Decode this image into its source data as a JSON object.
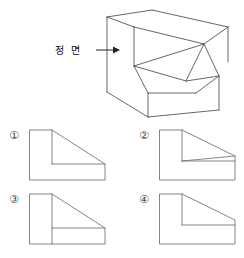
{
  "page": {
    "background_color": "#ffffff",
    "line_color": "#555555",
    "solid_line_color": "#4a4a4a",
    "text_color": "#111111",
    "width": 244,
    "height": 258
  },
  "annotation": {
    "front_view_label": "정 면",
    "arrow_icon": "arrow-right-icon",
    "arrow_direction": "right"
  },
  "solid": {
    "name": "isometric-solid-figure",
    "description_type": "pictorial",
    "outline_points": "107,17 152,10 228,27 228,62 196,73 196,117 108,117 108,92",
    "edges": [
      {
        "name": "top-back-left-edge",
        "d": "M107,17 L152,10"
      },
      {
        "name": "top-back-right-edge",
        "d": "M152,10 L228,27"
      },
      {
        "name": "right-vertical-back-edge",
        "d": "M228,27 L228,62"
      },
      {
        "name": "top-face-front-left-edge",
        "d": "M107,17 L134,27"
      },
      {
        "name": "top-face-front-right-edge",
        "d": "M134,27 L204,44"
      },
      {
        "name": "top-face-right-edge",
        "d": "M204,44 L228,27"
      },
      {
        "name": "front-upper-left-vertical",
        "d": "M134,27 L134,66"
      },
      {
        "name": "front-upper-bottom-edge",
        "d": "M134,66 L186,81"
      },
      {
        "name": "apex-to-left-ridge",
        "d": "M204,44 L134,66"
      },
      {
        "name": "apex-to-mid-ridge",
        "d": "M204,44 L186,81"
      },
      {
        "name": "apex-to-right-ridge",
        "d": "M204,44 L219,76"
      },
      {
        "name": "mid-to-right-ridge",
        "d": "M186,81 L219,76"
      },
      {
        "name": "slant-left-edge",
        "d": "M134,66 L148,93"
      },
      {
        "name": "slant-bottom-edge",
        "d": "M148,93 L196,93"
      },
      {
        "name": "slant-right-edge",
        "d": "M196,93 L219,76"
      },
      {
        "name": "right-face-vertical",
        "d": "M219,76 L219,110"
      },
      {
        "name": "left-outer-vertical",
        "d": "M107,17 L107,92"
      },
      {
        "name": "left-bottom-slant",
        "d": "M107,92 L148,117"
      },
      {
        "name": "base-bottom-edge",
        "d": "M148,117 L219,110"
      },
      {
        "name": "base-front-vertical",
        "d": "M148,93 L148,117"
      }
    ]
  },
  "options": [
    {
      "number": "①",
      "name": "option-1",
      "x": 30,
      "y": 130,
      "width": 75,
      "height": 50,
      "lines": [
        {
          "name": "outer-boundary",
          "d": "M0,0 L22,0 L75,34 L75,50 L0,50 Z"
        },
        {
          "name": "notch-vertical",
          "d": "M22,0 L22,34"
        },
        {
          "name": "notch-horizontal",
          "d": "M22,34 L75,34"
        }
      ]
    },
    {
      "number": "②",
      "name": "option-2",
      "x": 160,
      "y": 130,
      "width": 75,
      "height": 50,
      "lines": [
        {
          "name": "outer-boundary",
          "d": "M0,0 L22,0 L75,26 L75,50 L0,50 Z"
        },
        {
          "name": "notch-vertical",
          "d": "M22,0 L22,31"
        },
        {
          "name": "inner-diagonal",
          "d": "M22,31 L75,26"
        },
        {
          "name": "notch-horizontal",
          "d": "M22,31 L75,31"
        }
      ]
    },
    {
      "number": "③",
      "name": "option-3",
      "x": 30,
      "y": 194,
      "width": 75,
      "height": 50,
      "lines": [
        {
          "name": "outer-boundary",
          "d": "M0,0 L22,0 L75,34 L75,50 L0,50 Z"
        },
        {
          "name": "full-vertical",
          "d": "M22,0 L22,50"
        },
        {
          "name": "notch-horizontal",
          "d": "M22,34 L75,34"
        }
      ]
    },
    {
      "number": "④",
      "name": "option-4",
      "x": 160,
      "y": 194,
      "width": 75,
      "height": 50,
      "lines": [
        {
          "name": "outer-boundary",
          "d": "M0,0 L22,0 L75,26 L75,50 L0,50 Z"
        },
        {
          "name": "notch-vertical",
          "d": "M22,0 L22,31"
        },
        {
          "name": "notch-horizontal",
          "d": "M22,31 L75,31"
        }
      ]
    }
  ]
}
